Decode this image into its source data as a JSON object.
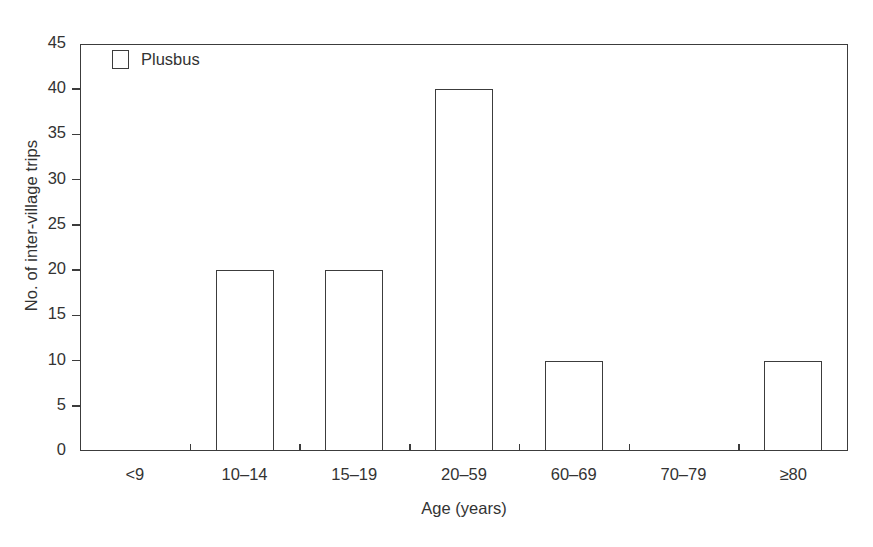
{
  "chart_data": {
    "type": "bar",
    "title": "",
    "subtitle": "",
    "xlabel": "Age (years)",
    "ylabel": "No. of inter-village trips",
    "categories": [
      "<9",
      "10–14",
      "15–19",
      "20–59",
      "60–69",
      "70–79",
      "≥80"
    ],
    "values": [
      0,
      20,
      20,
      40,
      10,
      0,
      10
    ],
    "series": [
      {
        "name": "Plusbus",
        "values": [
          0,
          20,
          20,
          40,
          10,
          0,
          10
        ]
      }
    ],
    "ylim": [
      0,
      45
    ],
    "xlim_categories": 7,
    "ytick_values": [
      0,
      5,
      10,
      15,
      20,
      25,
      30,
      35,
      40,
      45
    ],
    "ytick_labels": [
      "0",
      "5",
      "10",
      "15",
      "20",
      "25",
      "30",
      "35",
      "40",
      "45"
    ],
    "ytick_step": 5,
    "grid": false,
    "legend": {
      "position": "upper-left-inside",
      "entries": [
        {
          "label": "Plusbus",
          "marker": "open-square",
          "fill": "#ffffff",
          "edge": "#3c3c3c"
        }
      ]
    },
    "frame": "full-box",
    "bar_style": {
      "fill": "#ffffff",
      "edge": "#3c3c3c"
    }
  },
  "colors": {
    "background": "#ffffff",
    "line": "#3c3c3c",
    "text": "#333333",
    "bar_fill": "#ffffff",
    "bar_edge": "#3c3c3c"
  },
  "legend": {
    "swatch_icon": "open-square-icon",
    "label": "Plusbus"
  },
  "axes": {
    "y_title": "No. of inter-village trips",
    "x_title": "Age (years)"
  }
}
